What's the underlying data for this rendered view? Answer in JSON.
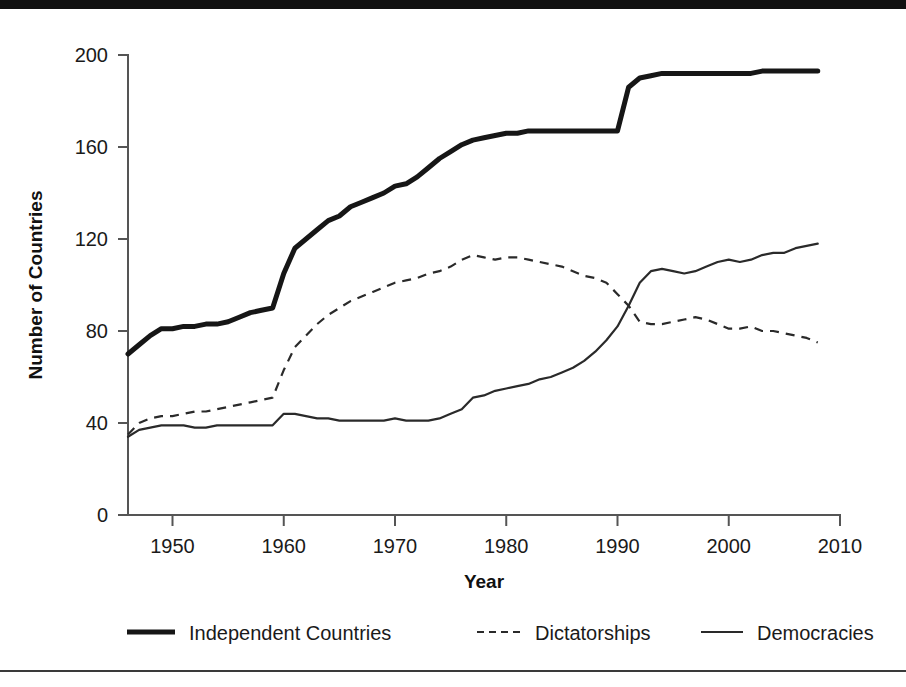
{
  "chart_data": {
    "type": "line",
    "title": "",
    "xlabel": "Year",
    "ylabel": "Number of Countries",
    "xlim": [
      1946,
      2008
    ],
    "ylim": [
      0,
      200
    ],
    "grid": false,
    "legend_position": "bottom",
    "xticks": [
      "1950",
      "1960",
      "1970",
      "1980",
      "1990",
      "2000",
      "2010"
    ],
    "xtick_values": [
      1950,
      1960,
      1970,
      1980,
      1990,
      2000,
      2010
    ],
    "yticks": [
      "0",
      "40",
      "80",
      "120",
      "160",
      "200"
    ],
    "ytick_values": [
      0,
      40,
      80,
      120,
      160,
      200
    ],
    "x": [
      1946,
      1947,
      1948,
      1949,
      1950,
      1951,
      1952,
      1953,
      1954,
      1955,
      1956,
      1957,
      1958,
      1959,
      1960,
      1961,
      1962,
      1963,
      1964,
      1965,
      1966,
      1967,
      1968,
      1969,
      1970,
      1971,
      1972,
      1973,
      1974,
      1975,
      1976,
      1977,
      1978,
      1979,
      1980,
      1981,
      1982,
      1983,
      1984,
      1985,
      1986,
      1987,
      1988,
      1989,
      1990,
      1991,
      1992,
      1993,
      1994,
      1995,
      1996,
      1997,
      1998,
      1999,
      2000,
      2001,
      2002,
      2003,
      2004,
      2005,
      2006,
      2007,
      2008
    ],
    "series": [
      {
        "name": "Independent Countries",
        "style": "thick-solid",
        "color": "#161616",
        "values": [
          70,
          74,
          78,
          81,
          81,
          82,
          82,
          83,
          83,
          84,
          86,
          88,
          89,
          90,
          105,
          116,
          120,
          124,
          128,
          130,
          134,
          136,
          138,
          140,
          143,
          144,
          147,
          151,
          155,
          158,
          161,
          163,
          164,
          165,
          166,
          166,
          167,
          167,
          167,
          167,
          167,
          167,
          167,
          167,
          167,
          186,
          190,
          191,
          192,
          192,
          192,
          192,
          192,
          192,
          192,
          192,
          192,
          193,
          193,
          193,
          193,
          193,
          193
        ]
      },
      {
        "name": "Dictatorships",
        "style": "dashed",
        "color": "#2a2a2a",
        "values": [
          35,
          40,
          42,
          43,
          43,
          44,
          45,
          45,
          46,
          47,
          48,
          49,
          50,
          51,
          63,
          73,
          78,
          83,
          87,
          90,
          93,
          95,
          97,
          99,
          101,
          102,
          103,
          105,
          106,
          108,
          111,
          113,
          112,
          111,
          112,
          112,
          111,
          110,
          109,
          108,
          106,
          104,
          103,
          101,
          96,
          91,
          84,
          83,
          83,
          84,
          85,
          86,
          85,
          83,
          81,
          81,
          82,
          80,
          80,
          79,
          78,
          77,
          75
        ]
      },
      {
        "name": "Democracies",
        "style": "thin-solid",
        "color": "#2a2a2a",
        "values": [
          34,
          37,
          38,
          39,
          39,
          39,
          38,
          38,
          39,
          39,
          39,
          39,
          39,
          39,
          44,
          44,
          43,
          42,
          42,
          41,
          41,
          41,
          41,
          41,
          42,
          41,
          41,
          41,
          42,
          44,
          46,
          51,
          52,
          54,
          55,
          56,
          57,
          59,
          60,
          62,
          64,
          67,
          71,
          76,
          82,
          91,
          101,
          106,
          107,
          106,
          105,
          106,
          108,
          110,
          111,
          110,
          111,
          113,
          114,
          114,
          116,
          117,
          118
        ]
      }
    ]
  },
  "legend": {
    "items": [
      {
        "label": "Independent Countries",
        "style": "thick-solid"
      },
      {
        "label": "Dictatorships",
        "style": "dashed"
      },
      {
        "label": "Democracies",
        "style": "thin-solid"
      }
    ]
  }
}
